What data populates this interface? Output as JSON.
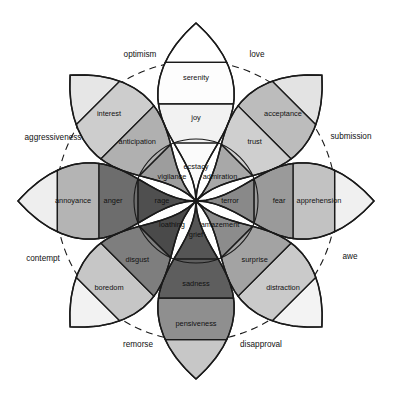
{
  "figure": {
    "center": {
      "x": 196,
      "y": 201
    },
    "background": "#ffffff",
    "stroke": "#1a1a1a"
  },
  "chart_data": {
    "type": "pie",
    "subtitle": "",
    "xlabel": "",
    "ylabel": "",
    "legend_position": "none",
    "grid": false,
    "rings": [
      {
        "name": "inner-dotted-ring",
        "radius": 92,
        "dash": "2 3"
      },
      {
        "name": "outer-dashed-ring",
        "radius": 140,
        "dash": "7 5"
      }
    ],
    "intensity_levels": [
      "intense (core)",
      "basic (middle)",
      "mild (outer)"
    ],
    "petals": [
      {
        "axis": "joy",
        "angle_deg": 270,
        "direction": "up",
        "levels": [
          {
            "level": "intense",
            "label": "ecstacy",
            "color": "#fbfbfb"
          },
          {
            "level": "basic",
            "label": "joy",
            "color": "#f2f2f2"
          },
          {
            "level": "mild",
            "label": "serenity",
            "color": "#fdfdfd"
          }
        ],
        "tip_color": "#ffffff"
      },
      {
        "axis": "trust",
        "angle_deg": 315,
        "direction": "up-right",
        "levels": [
          {
            "level": "intense",
            "label": "admiration",
            "color": "#a8a8a8"
          },
          {
            "level": "basic",
            "label": "trust",
            "color": "#cfcfcf"
          },
          {
            "level": "mild",
            "label": "acceptance",
            "color": "#bcbcbc"
          }
        ],
        "tip_color": "#e3e3e3"
      },
      {
        "axis": "fear",
        "angle_deg": 0,
        "direction": "right",
        "levels": [
          {
            "level": "intense",
            "label": "terror",
            "color": "#898989"
          },
          {
            "level": "basic",
            "label": "fear",
            "color": "#9a9a9a"
          },
          {
            "level": "mild",
            "label": "apprehension",
            "color": "#c2c2c2"
          }
        ],
        "tip_color": "#f0f0f0"
      },
      {
        "axis": "surprise",
        "angle_deg": 45,
        "direction": "down-right",
        "levels": [
          {
            "level": "intense",
            "label": "amazement",
            "color": "#8c8c8c"
          },
          {
            "level": "basic",
            "label": "surprise",
            "color": "#a3a3a3"
          },
          {
            "level": "mild",
            "label": "distraction",
            "color": "#cacaca"
          }
        ],
        "tip_color": "#f3f3f3"
      },
      {
        "axis": "sadness",
        "angle_deg": 90,
        "direction": "down",
        "levels": [
          {
            "level": "intense",
            "label": "grief",
            "color": "#555555"
          },
          {
            "level": "basic",
            "label": "sadness",
            "color": "#5e5e5e"
          },
          {
            "level": "mild",
            "label": "pensiveness",
            "color": "#8f8f8f"
          }
        ],
        "tip_color": "#c7c7c7"
      },
      {
        "axis": "disgust",
        "angle_deg": 135,
        "direction": "down-left",
        "levels": [
          {
            "level": "intense",
            "label": "loathing",
            "color": "#4a4a4a"
          },
          {
            "level": "basic",
            "label": "disgust",
            "color": "#7e7e7e"
          },
          {
            "level": "mild",
            "label": "boredom",
            "color": "#c6c6c6"
          }
        ],
        "tip_color": "#f2f2f2"
      },
      {
        "axis": "anger",
        "angle_deg": 180,
        "direction": "left",
        "levels": [
          {
            "level": "intense",
            "label": "rage",
            "color": "#4f4f4f"
          },
          {
            "level": "basic",
            "label": "anger",
            "color": "#6d6d6d"
          },
          {
            "level": "mild",
            "label": "annoyance",
            "color": "#b4b4b4"
          }
        ],
        "tip_color": "#eeeeee"
      },
      {
        "axis": "anticipation",
        "angle_deg": 225,
        "direction": "up-left",
        "levels": [
          {
            "level": "intense",
            "label": "vigilance",
            "color": "#9d9d9d"
          },
          {
            "level": "basic",
            "label": "anticipation",
            "color": "#b0b0b0"
          },
          {
            "level": "mild",
            "label": "interest",
            "color": "#cdcdcd"
          }
        ],
        "tip_color": "#e6e6e6"
      }
    ],
    "dyads": [
      {
        "label": "optimism",
        "between": [
          "anticipation",
          "joy"
        ],
        "x": 140,
        "y": 55
      },
      {
        "label": "love",
        "between": [
          "joy",
          "trust"
        ],
        "x": 257,
        "y": 55
      },
      {
        "label": "submission",
        "between": [
          "trust",
          "fear"
        ],
        "x": 351,
        "y": 137
      },
      {
        "label": "awe",
        "between": [
          "fear",
          "surprise"
        ],
        "x": 350,
        "y": 257
      },
      {
        "label": "disapproval",
        "between": [
          "surprise",
          "sadness"
        ],
        "x": 261,
        "y": 345
      },
      {
        "label": "remorse",
        "between": [
          "sadness",
          "disgust"
        ],
        "x": 138,
        "y": 345
      },
      {
        "label": "contempt",
        "between": [
          "disgust",
          "anger"
        ],
        "x": 43,
        "y": 259
      },
      {
        "label": "aggressiveness",
        "between": [
          "anger",
          "anticipation"
        ],
        "x": 53,
        "y": 138
      }
    ]
  }
}
